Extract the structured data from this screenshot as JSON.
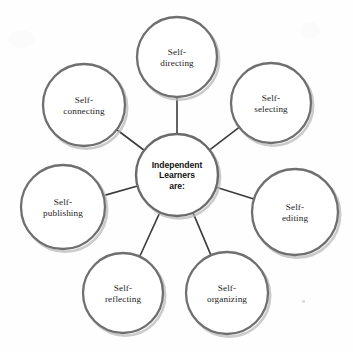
{
  "diagram": {
    "type": "hub-and-spoke",
    "hub": {
      "name": "independent-learners-hub",
      "lines": [
        "Independent",
        "Learners",
        "are:"
      ],
      "cx": 177,
      "cy": 175,
      "r": 41
    },
    "nodes": [
      {
        "id": "self-directing",
        "lines": [
          "Self-",
          "directing"
        ],
        "cx": 177,
        "cy": 57,
        "r": 40
      },
      {
        "id": "self-selecting",
        "lines": [
          "Self-",
          "selecting"
        ],
        "cx": 271,
        "cy": 103,
        "r": 40
      },
      {
        "id": "self-editing",
        "lines": [
          "Self-",
          "editing"
        ],
        "cx": 295,
        "cy": 212,
        "r": 43
      },
      {
        "id": "self-organizing",
        "lines": [
          "Self-",
          "organizing"
        ],
        "cx": 227,
        "cy": 293,
        "r": 41
      },
      {
        "id": "self-reflecting",
        "lines": [
          "Self-",
          "reflecting"
        ],
        "cx": 123,
        "cy": 293,
        "r": 40
      },
      {
        "id": "self-publishing",
        "lines": [
          "Self-",
          "publishing"
        ],
        "cx": 63,
        "cy": 207,
        "r": 42
      },
      {
        "id": "self-connecting",
        "lines": [
          "Self-",
          "connecting"
        ],
        "cx": 84,
        "cy": 105,
        "r": 41
      }
    ],
    "colors": {
      "node_stroke": "#6f6f6f",
      "hub_stroke": "#6a6a6a",
      "spoke": "#3b3b3b",
      "node_fill": "#ffffff",
      "text": "#1d1d1d",
      "background": "#fefefe",
      "shadow": "#b9b9b9"
    }
  }
}
